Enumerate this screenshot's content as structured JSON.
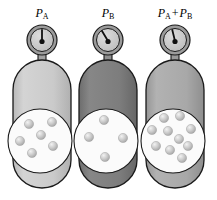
{
  "figure": {
    "background_color": "#ffffff",
    "width": 217,
    "height": 200
  },
  "colors": {
    "outline": "#1a1a1a",
    "cylinder_light": "#cfcfcf",
    "cylinder_light_edge": "#b4b4b4",
    "cylinder_dark": "#7e7e7e",
    "cylinder_dark_edge": "#6a6a6a",
    "cylinder_medium": "#a9a9a9",
    "cylinder_medium_edge": "#949494",
    "gauge_face": "#c9c9c9",
    "gauge_rim": "#9a9a9a",
    "gauge_bezel": "#8e8e8e",
    "needle": "#111111",
    "magnifier_fill": "#fbfbfb",
    "particle": "#c2c2c2",
    "particle_highlight": "#efefef",
    "particle_edge": "#9d9d9d",
    "neck": "#9f9f9f"
  },
  "units": [
    {
      "id": "cylinder-a",
      "label": {
        "text": "P_A",
        "symbol": "P",
        "subscript": "A",
        "operator": "",
        "symbol2": "",
        "subscript2": ""
      },
      "gauge": {
        "name": "pressure-gauge-a",
        "needle_angle_deg": 0,
        "reading_description": "needle vertical, pointing straight up"
      },
      "cylinder": {
        "fill": "#cfcfcf",
        "shade": "light",
        "gas": "Gas A"
      },
      "magnifier": {
        "particle_count": 6,
        "particles": [
          {
            "x": 21,
            "y": 16
          },
          {
            "x": 44,
            "y": 14
          },
          {
            "x": 33,
            "y": 27
          },
          {
            "x": 12,
            "y": 33
          },
          {
            "x": 45,
            "y": 38
          },
          {
            "x": 24,
            "y": 45
          }
        ]
      }
    },
    {
      "id": "cylinder-b",
      "label": {
        "text": "P_B",
        "symbol": "P",
        "subscript": "B",
        "operator": "",
        "symbol2": "",
        "subscript2": ""
      },
      "gauge": {
        "name": "pressure-gauge-b",
        "needle_angle_deg": -32,
        "reading_description": "needle tilted toward upper left"
      },
      "cylinder": {
        "fill": "#7e7e7e",
        "shade": "dark",
        "gas": "Gas B"
      },
      "magnifier": {
        "particle_count": 4,
        "particles": [
          {
            "x": 30,
            "y": 12
          },
          {
            "x": 15,
            "y": 29
          },
          {
            "x": 49,
            "y": 30
          },
          {
            "x": 31,
            "y": 47
          }
        ]
      }
    },
    {
      "id": "cylinder-a-plus-b",
      "label": {
        "text": "P_A + P_B",
        "symbol": "P",
        "subscript": "A",
        "operator": "+",
        "symbol2": "P",
        "subscript2": "B"
      },
      "gauge": {
        "name": "pressure-gauge-a-plus-b",
        "needle_angle_deg": -14,
        "reading_description": "needle tilted slightly toward upper left"
      },
      "cylinder": {
        "fill": "#a9a9a9",
        "shade": "medium",
        "gas": "Gas A + Gas B"
      },
      "magnifier": {
        "particle_count": 10,
        "particles": [
          {
            "x": 23,
            "y": 11
          },
          {
            "x": 39,
            "y": 9
          },
          {
            "x": 11,
            "y": 23
          },
          {
            "x": 27,
            "y": 24
          },
          {
            "x": 50,
            "y": 22
          },
          {
            "x": 38,
            "y": 31
          },
          {
            "x": 15,
            "y": 38
          },
          {
            "x": 29,
            "y": 42
          },
          {
            "x": 47,
            "y": 38
          },
          {
            "x": 41,
            "y": 49
          }
        ]
      }
    }
  ],
  "geometry": {
    "unit_left_offsets": [
      6,
      72,
      139
    ],
    "gauge_center_x": 36,
    "gauge_center_y": 40,
    "gauge_outer_radius": 15,
    "gauge_face_radius": 11,
    "neck_top": 54,
    "neck_bottom": 64,
    "cylinder_top": 62,
    "cylinder_bottom": 186,
    "cylinder_left": 7,
    "cylinder_right": 65,
    "magnifier_center_x": 34,
    "magnifier_center_y": 141,
    "magnifier_radius": 32
  }
}
